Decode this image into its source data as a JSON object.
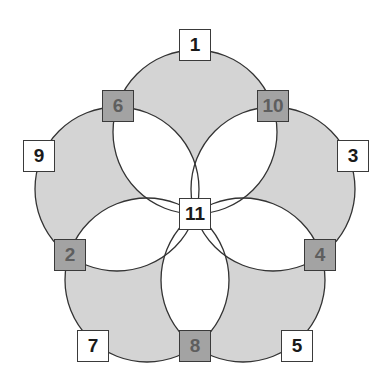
{
  "diagram": {
    "type": "five-circle-flower",
    "colors": {
      "circle_fill": "#d4d4d4",
      "lens_fill": "#ffffff",
      "stroke": "#333333",
      "light_box": "#ffffff",
      "dark_box": "#a3a3a3"
    },
    "nodes": [
      {
        "id": "1",
        "label": "1",
        "style": "light",
        "x": 195,
        "y": 45
      },
      {
        "id": "6",
        "label": "6",
        "style": "dark",
        "x": 118,
        "y": 106
      },
      {
        "id": "10",
        "label": "10",
        "style": "dark",
        "x": 273,
        "y": 106
      },
      {
        "id": "9",
        "label": "9",
        "style": "light",
        "x": 39,
        "y": 156
      },
      {
        "id": "3",
        "label": "3",
        "style": "light",
        "x": 353,
        "y": 156
      },
      {
        "id": "11",
        "label": "11",
        "style": "light",
        "x": 195,
        "y": 214
      },
      {
        "id": "2",
        "label": "2",
        "style": "dark",
        "x": 70,
        "y": 255
      },
      {
        "id": "4",
        "label": "4",
        "style": "dark",
        "x": 320,
        "y": 255
      },
      {
        "id": "7",
        "label": "7",
        "style": "light",
        "x": 93,
        "y": 346
      },
      {
        "id": "8",
        "label": "8",
        "style": "dark",
        "x": 195,
        "y": 346
      },
      {
        "id": "5",
        "label": "5",
        "style": "light",
        "x": 297,
        "y": 346
      }
    ]
  }
}
